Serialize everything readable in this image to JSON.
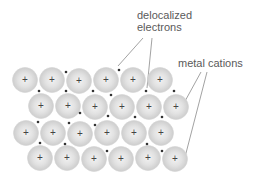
{
  "diagram": {
    "labels": {
      "delocalized_line1": "delocalized",
      "delocalized_line2": "electrons",
      "metal_cations": "metal cations"
    },
    "cation_symbol": "+",
    "cation_radius": 12.5,
    "colors": {
      "cation_fill_outer": "#cfcfcf",
      "cation_fill_inner": "#ececec",
      "plus": "#444444",
      "electron": "#333333",
      "leader_line": "#8a8a8a",
      "label_text": "#5a5a5a"
    },
    "cations": [
      {
        "x": 25,
        "y": 80
      },
      {
        "x": 52,
        "y": 80
      },
      {
        "x": 79,
        "y": 81
      },
      {
        "x": 106,
        "y": 80
      },
      {
        "x": 133,
        "y": 80
      },
      {
        "x": 160,
        "y": 80
      },
      {
        "x": 41,
        "y": 106
      },
      {
        "x": 68,
        "y": 106
      },
      {
        "x": 95,
        "y": 107
      },
      {
        "x": 122,
        "y": 107
      },
      {
        "x": 149,
        "y": 107
      },
      {
        "x": 176,
        "y": 107
      },
      {
        "x": 26,
        "y": 133
      },
      {
        "x": 53,
        "y": 133
      },
      {
        "x": 80,
        "y": 134
      },
      {
        "x": 107,
        "y": 133
      },
      {
        "x": 134,
        "y": 133
      },
      {
        "x": 161,
        "y": 133
      },
      {
        "x": 40,
        "y": 158
      },
      {
        "x": 67,
        "y": 158
      },
      {
        "x": 94,
        "y": 159
      },
      {
        "x": 121,
        "y": 159
      },
      {
        "x": 148,
        "y": 158
      },
      {
        "x": 175,
        "y": 159
      }
    ],
    "electrons": [
      {
        "x": 66,
        "y": 72
      },
      {
        "x": 119,
        "y": 70
      },
      {
        "x": 39,
        "y": 91
      },
      {
        "x": 66,
        "y": 91
      },
      {
        "x": 93,
        "y": 91
      },
      {
        "x": 111,
        "y": 95
      },
      {
        "x": 146,
        "y": 91
      },
      {
        "x": 174,
        "y": 91
      },
      {
        "x": 80,
        "y": 113
      },
      {
        "x": 108,
        "y": 116
      },
      {
        "x": 135,
        "y": 117
      },
      {
        "x": 162,
        "y": 117
      },
      {
        "x": 38,
        "y": 122
      },
      {
        "x": 69,
        "y": 123
      },
      {
        "x": 95,
        "y": 125
      },
      {
        "x": 40,
        "y": 143
      },
      {
        "x": 65,
        "y": 144
      },
      {
        "x": 107,
        "y": 151
      },
      {
        "x": 147,
        "y": 144
      },
      {
        "x": 162,
        "y": 151
      }
    ],
    "leader_lines": [
      {
        "target": "electron",
        "x1": 143,
        "y1": 38,
        "x2": 118,
        "y2": 66
      },
      {
        "target": "electron",
        "x1": 152,
        "y1": 38,
        "x2": 147,
        "y2": 88
      },
      {
        "target": "cation",
        "x1": 201,
        "y1": 72,
        "x2": 184,
        "y2": 103
      },
      {
        "target": "cation",
        "x1": 207,
        "y1": 72,
        "x2": 185,
        "y2": 157
      }
    ]
  }
}
